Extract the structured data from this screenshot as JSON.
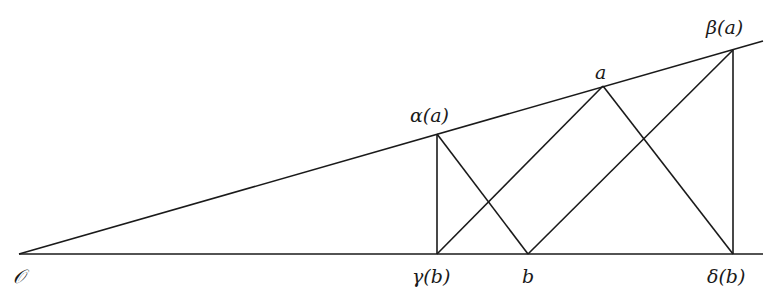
{
  "diagram": {
    "type": "geometric-construction",
    "points": {
      "O": {
        "label": "𝒪",
        "x": 19,
        "y": 254
      },
      "alpha_a": {
        "label": "α(a)",
        "x": 437,
        "y": 134
      },
      "gamma_b": {
        "label": "γ(b)",
        "x": 437,
        "y": 254
      },
      "b": {
        "label": "b",
        "x": 528,
        "y": 254
      },
      "a": {
        "label": "a",
        "x": 603,
        "y": 86
      },
      "beta_a": {
        "label": "β(a)",
        "x": 733,
        "y": 50
      },
      "delta_b": {
        "label": "δ(b)",
        "x": 733,
        "y": 254
      }
    },
    "labels": {
      "origin": "𝒪",
      "alpha_a": "α(a)",
      "gamma_b": "γ(b)",
      "b": "b",
      "a": "a",
      "beta_a": "β(a)",
      "delta_b": "δ(b)"
    },
    "line_color": "#1a1a1a"
  }
}
